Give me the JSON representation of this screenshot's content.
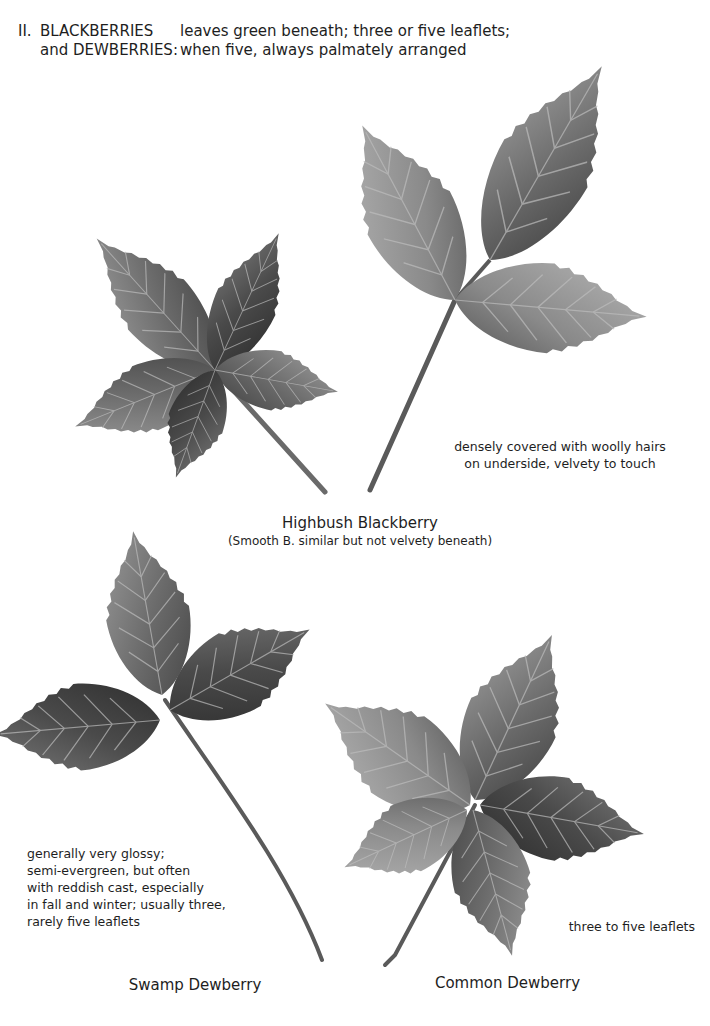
{
  "header": {
    "section_number": "II.",
    "group_line1": "BLACKBERRIES",
    "group_line2": "and  DEWBERRIES:",
    "desc_line1": "leaves green beneath; three or five leaflets;",
    "desc_line2": "when five, always palmately arranged"
  },
  "specimens": [
    {
      "name": "Highbush Blackberry",
      "subcaption": "(Smooth B. similar but not velvety beneath)",
      "note_lines": [
        "densely covered with woolly hairs",
        "on underside, velvety to touch"
      ],
      "images": [
        "five-leaflet leaf",
        "three-leaflet leaf"
      ]
    },
    {
      "name": "Swamp Dewberry",
      "note_lines": [
        "generally very glossy;",
        "semi-evergreen, but often",
        "with reddish cast, especially",
        "in fall and winter; usually three,",
        "rarely five leaflets"
      ],
      "images": [
        "three-leaflet leaf"
      ]
    },
    {
      "name": "Common Dewberry",
      "note_lines": [
        "three to five leaflets"
      ],
      "images": [
        "five-leaflet leaf"
      ]
    }
  ],
  "colors": {
    "leaf_dark": "#3a3a3a",
    "leaf_mid": "#6e6e6e",
    "leaf_light": "#9a9a9a",
    "text": "#1e1e1e"
  }
}
